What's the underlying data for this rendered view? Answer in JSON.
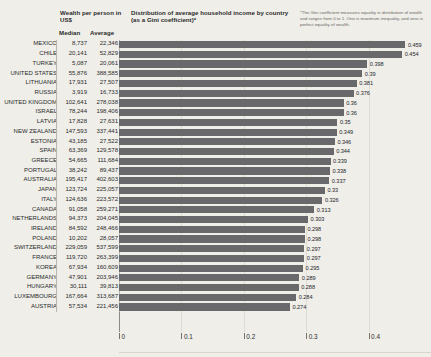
{
  "header": {
    "wealth_title": "Wealth per person in US$",
    "distribution_title": "Distribution of average household income by country (as a Gini coefficient)*",
    "footnote": "*The Gini coefficient measures equality in distribution of wealth and ranges from 0 to 1. One is maximum inequality, and zero is perfect equality of wealth.",
    "col_median": "Median",
    "col_average": "Average"
  },
  "chart_data": {
    "type": "bar",
    "title": "Distribution of average household income by country (as a Gini coefficient)*",
    "xlabel": "",
    "ylabel": "",
    "xlim": [
      0,
      0.5
    ],
    "orientation": "horizontal",
    "grid": true,
    "legend": "none",
    "bar_color": "#69686a",
    "background": "#efeee9",
    "tick_labels": [
      "0",
      "0.1",
      "0.2",
      "0.3",
      "0.4",
      "0.5"
    ],
    "tick_values": [
      0,
      0.1,
      0.2,
      0.3,
      0.4,
      0.5
    ],
    "categories": [
      "MEXICO",
      "CHILE",
      "TURKEY",
      "UNITED STATES",
      "LITHUANIA",
      "RUSSIA",
      "UNITED KINGDOM",
      "ISRAEL",
      "LATVIA",
      "NEW ZEALAND",
      "ESTONIA",
      "SPAIN",
      "GREECE",
      "PORTUGAL",
      "AUSTRALIA",
      "JAPAN",
      "ITALY",
      "CANADA",
      "NETHERLANDS",
      "IRELAND",
      "POLAND",
      "SWITZERLAND",
      "FRANCE",
      "KOREA",
      "GERMANY",
      "HUNGARY",
      "LUXEMBOURG",
      "AUSTRIA"
    ],
    "values": [
      0.459,
      0.454,
      0.398,
      0.39,
      0.381,
      0.376,
      0.36,
      0.36,
      0.35,
      0.349,
      0.346,
      0.344,
      0.339,
      0.338,
      0.337,
      0.33,
      0.326,
      0.313,
      0.303,
      0.298,
      0.298,
      0.297,
      0.297,
      0.295,
      0.289,
      0.288,
      0.284,
      0.274
    ],
    "value_labels": [
      "0.459",
      "0.454",
      "0.398",
      "0.39",
      "0.381",
      "0.376",
      "0.36",
      "0.36",
      "0.35",
      "0.349",
      "0.346",
      "0.344",
      "0.339",
      "0.338",
      "0.337",
      "0.33",
      "0.326",
      "0.313",
      "0.303",
      "0.298",
      "0.298",
      "0.297",
      "0.297",
      "0.295",
      "0.289",
      "0.288",
      "0.284",
      "0.274"
    ],
    "median_wealth": [
      "8,737",
      "20,141",
      "5,087",
      "55,876",
      "17,931",
      "3,919",
      "102,641",
      "78,244",
      "17,828",
      "147,593",
      "43,185",
      "63,369",
      "54,665",
      "38,242",
      "195,417",
      "123,724",
      "124,636",
      "91,058",
      "94,373",
      "84,592",
      "10,202",
      "229,059",
      "119,720",
      "67,934",
      "47,901",
      "30,111",
      "167,664",
      "57,534"
    ],
    "average_wealth": [
      "22,346",
      "52,829",
      "20,061",
      "388,585",
      "27,507",
      "16,733",
      "278,038",
      "198,406",
      "27,631",
      "337,441",
      "27,522",
      "129,578",
      "111,684",
      "89,437",
      "402,603",
      "225,057",
      "223,572",
      "259,271",
      "204,045",
      "248,466",
      "28,057",
      "537,599",
      "263,399",
      "160,609",
      "203,946",
      "39,813",
      "313,687",
      "221,456"
    ]
  },
  "rows": [
    {
      "country": "MEXICO",
      "median": "8,737",
      "average": "22,346",
      "gini": "0.459",
      "v": 0.459
    },
    {
      "country": "CHILE",
      "median": "20,141",
      "average": "52,829",
      "gini": "0.454",
      "v": 0.454
    },
    {
      "country": "TURKEY",
      "median": "5,087",
      "average": "20,061",
      "gini": "0.398",
      "v": 0.398
    },
    {
      "country": "UNITED STATES",
      "median": "55,876",
      "average": "388,585",
      "gini": "0.39",
      "v": 0.39
    },
    {
      "country": "LITHUANIA",
      "median": "17,931",
      "average": "27,507",
      "gini": "0.381",
      "v": 0.381
    },
    {
      "country": "RUSSIA",
      "median": "3,919",
      "average": "16,733",
      "gini": "0.376",
      "v": 0.376
    },
    {
      "country": "UNITED KINGDOM",
      "median": "102,641",
      "average": "278,038",
      "gini": "0.36",
      "v": 0.36
    },
    {
      "country": "ISRAEL",
      "median": "78,244",
      "average": "198,406",
      "gini": "0.36",
      "v": 0.36
    },
    {
      "country": "LATVIA",
      "median": "17,828",
      "average": "27,631",
      "gini": "0.35",
      "v": 0.35
    },
    {
      "country": "NEW ZEALAND",
      "median": "147,593",
      "average": "337,441",
      "gini": "0.349",
      "v": 0.349
    },
    {
      "country": "ESTONIA",
      "median": "43,185",
      "average": "27,522",
      "gini": "0.346",
      "v": 0.346
    },
    {
      "country": "SPAIN",
      "median": "63,369",
      "average": "129,578",
      "gini": "0.344",
      "v": 0.344
    },
    {
      "country": "GREECE",
      "median": "54,665",
      "average": "111,684",
      "gini": "0.339",
      "v": 0.339
    },
    {
      "country": "PORTUGAL",
      "median": "38,242",
      "average": "89,437",
      "gini": "0.338",
      "v": 0.338
    },
    {
      "country": "AUSTRALIA",
      "median": "195,417",
      "average": "402,603",
      "gini": "0.337",
      "v": 0.337
    },
    {
      "country": "JAPAN",
      "median": "123,724",
      "average": "225,057",
      "gini": "0.33",
      "v": 0.33
    },
    {
      "country": "ITALY",
      "median": "124,636",
      "average": "223,572",
      "gini": "0.326",
      "v": 0.326
    },
    {
      "country": "CANADA",
      "median": "91,058",
      "average": "259,271",
      "gini": "0.313",
      "v": 0.313
    },
    {
      "country": "NETHERLANDS",
      "median": "94,373",
      "average": "204,045",
      "gini": "0.303",
      "v": 0.303
    },
    {
      "country": "IRELAND",
      "median": "84,592",
      "average": "248,466",
      "gini": "0.298",
      "v": 0.298
    },
    {
      "country": "POLAND",
      "median": "10,202",
      "average": "28,057",
      "gini": "0.298",
      "v": 0.298
    },
    {
      "country": "SWITZERLAND",
      "median": "229,059",
      "average": "537,599",
      "gini": "0.297",
      "v": 0.297
    },
    {
      "country": "FRANCE",
      "median": "119,720",
      "average": "263,399",
      "gini": "0.297",
      "v": 0.297
    },
    {
      "country": "KOREA",
      "median": "67,934",
      "average": "160,609",
      "gini": "0.295",
      "v": 0.295
    },
    {
      "country": "GERMANY",
      "median": "47,901",
      "average": "203,946",
      "gini": "0.289",
      "v": 0.289
    },
    {
      "country": "HUNGARY",
      "median": "30,111",
      "average": "39,813",
      "gini": "0.288",
      "v": 0.288
    },
    {
      "country": "LUXEMBOURG",
      "median": "167,664",
      "average": "313,687",
      "gini": "0.284",
      "v": 0.284
    },
    {
      "country": "AUSTRIA",
      "median": "57,534",
      "average": "221,456",
      "gini": "0.274",
      "v": 0.274
    }
  ]
}
